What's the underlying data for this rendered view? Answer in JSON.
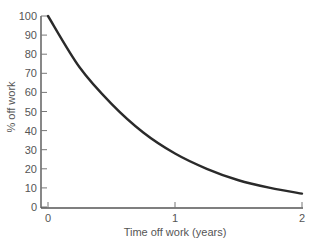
{
  "chart_data": {
    "type": "line",
    "title": "",
    "xlabel": "Time off work (years)",
    "ylabel": "% off work",
    "xlim": [
      0,
      2
    ],
    "ylim": [
      0,
      100
    ],
    "x_ticks": [
      0,
      1,
      2
    ],
    "y_ticks": [
      0,
      10,
      20,
      30,
      40,
      50,
      60,
      70,
      80,
      90,
      100
    ],
    "grid": false,
    "legend": null,
    "series": [
      {
        "name": "% off work",
        "x": [
          0,
          0.25,
          0.5,
          0.75,
          1.0,
          1.25,
          1.5,
          1.75,
          2.0
        ],
        "y": [
          100,
          73,
          54,
          39,
          28,
          20,
          14,
          10,
          7
        ]
      }
    ]
  },
  "colors": {
    "curve": "#2a2a2a",
    "axis": "#555555",
    "text": "#555555"
  }
}
